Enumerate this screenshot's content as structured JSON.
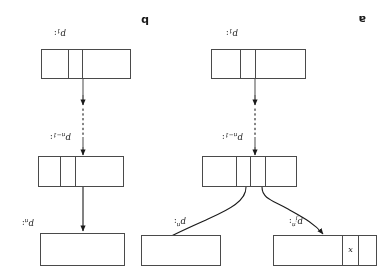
{
  "figure": {
    "rotation_degrees": 180,
    "stroke_color": "#4a4a4a",
    "text_color": "#1a1a1a",
    "background_color": "#ffffff",
    "panels": [
      {
        "id": "a",
        "tag": "a",
        "side": "right",
        "nodes": [
          {
            "id": "a-p1",
            "label_base": "p",
            "label_sub": "1",
            "label_sup": "",
            "label_colon": ":",
            "cells": [
              "",
              "",
              ""
            ]
          },
          {
            "id": "a-pn1",
            "label_base": "p",
            "label_sub": "n−1",
            "label_sup": "",
            "label_colon": ":",
            "cells": [
              "",
              "",
              ""
            ]
          },
          {
            "id": "a-pn",
            "label_base": "p",
            "label_sub": "n",
            "label_sup": "",
            "label_colon": ":",
            "cells": [
              ""
            ]
          }
        ],
        "arrows": [
          "p1-to-dots",
          "dots-to-pn1",
          "pn1-to-pn"
        ]
      },
      {
        "id": "b",
        "tag": "b",
        "side": "left",
        "nodes": [
          {
            "id": "b-p1",
            "label_base": "p",
            "label_sub": "1",
            "label_sup": "",
            "label_colon": ":",
            "cells": [
              "",
              "",
              ""
            ]
          },
          {
            "id": "b-pn1",
            "label_base": "p",
            "label_sub": "n−1",
            "label_sup": "",
            "label_colon": ":",
            "cells": [
              "",
              "",
              "",
              ""
            ]
          },
          {
            "id": "b-pn",
            "label_base": "p",
            "label_sub": "",
            "label_sup": "n",
            "label_colon": ":",
            "cells": [
              ""
            ]
          },
          {
            "id": "b-pjn",
            "label_base": "p",
            "label_sub": "j",
            "label_sup": "n",
            "label_colon": ":",
            "cells": [
              "",
              "x",
              ""
            ]
          }
        ],
        "arrows": [
          "p1-to-dots",
          "dots-to-pn1",
          "pn1-curve-to-pjn",
          "pn1-curve-to-pn"
        ]
      }
    ],
    "cell_values": {
      "x": "x"
    }
  }
}
